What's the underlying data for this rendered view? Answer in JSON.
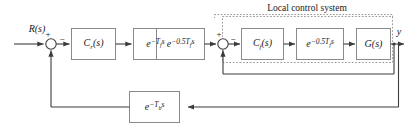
{
  "diagram": {
    "type": "block-diagram",
    "group_box": {
      "label": "Local control system"
    },
    "signals": {
      "input": "R(s)",
      "output": "y"
    },
    "summing_junctions": [
      {
        "id": "outer-sum",
        "plus": "+",
        "minus": "−"
      },
      {
        "id": "inner-sum",
        "plus": "+",
        "minus": "−"
      }
    ],
    "blocks": [
      {
        "id": "cr",
        "label": "C",
        "sub": "r",
        "tail": "(s)"
      },
      {
        "id": "delay-tf",
        "label": "e",
        "exp_base": "−T",
        "exp_sub": "f",
        "exp_tail": "s"
      },
      {
        "id": "delay-half-tf-1",
        "label": "e",
        "exp_base": "−0.5T",
        "exp_sub": "f",
        "exp_tail": "s"
      },
      {
        "id": "cf",
        "label": "C",
        "sub": "f",
        "tail": "(s)"
      },
      {
        "id": "delay-half-tf-2",
        "label": "e",
        "exp_base": "−0.5T",
        "exp_sub": "f",
        "exp_tail": "s"
      },
      {
        "id": "plant",
        "label": "G",
        "sub": "",
        "tail": "(s)"
      },
      {
        "id": "delay-tb",
        "label": "e",
        "exp_base": "−T",
        "exp_sub": "b",
        "exp_tail": "s"
      }
    ],
    "colors": {
      "line": "#3c3c3c",
      "block_border": "#8a8a8a",
      "group_border": "#9a9a9a",
      "text": "#1a1a1a",
      "background": "#ffffff"
    }
  }
}
